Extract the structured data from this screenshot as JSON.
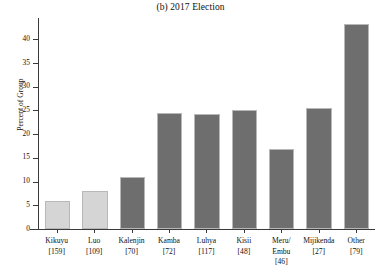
{
  "chart_data": {
    "type": "bar",
    "title": "(b) 2017 Election",
    "xlabel": "",
    "ylabel": "Percent of Group",
    "ylim": [
      0,
      44.5
    ],
    "yticks": [
      0,
      5,
      10,
      15,
      20,
      25,
      30,
      35,
      40
    ],
    "grid": false,
    "legend": "none",
    "categories": [
      "Kikuyu",
      "Luo",
      "Kalenjin",
      "Kamba",
      "Luhya",
      "Kisii",
      "Meru/ Embu",
      "Mijikenda",
      "Other"
    ],
    "category_counts": [
      "[159]",
      "[109]",
      "[70]",
      "[72]",
      "[117]",
      "[48]",
      "[46]",
      "[27]",
      "[79]"
    ],
    "values": [
      6.0,
      8.1,
      11.0,
      24.5,
      24.3,
      25.2,
      16.9,
      25.6,
      43.3
    ],
    "bar_colors": [
      "#d5d5d5",
      "#d5d5d5",
      "#6e6e6e",
      "#6e6e6e",
      "#6e6e6e",
      "#6e6e6e",
      "#6e6e6e",
      "#6e6e6e",
      "#6e6e6e"
    ],
    "bar_edge_color": "#b8b8b8",
    "axis_color": "#3a3a3a",
    "background_color": "#ffffff"
  },
  "ytick_labels": [
    "0",
    "5",
    "10",
    "15",
    "20",
    "25",
    "30",
    "35",
    "40"
  ],
  "xtick_labels": [
    {
      "name": "Kikuyu",
      "count": "[159]"
    },
    {
      "name": "Luo",
      "count": "[109]"
    },
    {
      "name": "Kalenjin",
      "count": "[70]"
    },
    {
      "name": "Kamba",
      "count": "[72]"
    },
    {
      "name": "Luhya",
      "count": "[117]"
    },
    {
      "name": "Kisii",
      "count": "[48]"
    },
    {
      "name": "Meru/ Embu",
      "count": "[46]"
    },
    {
      "name": "Mijikenda",
      "count": "[27]"
    },
    {
      "name": "Other",
      "count": "[79]"
    }
  ]
}
